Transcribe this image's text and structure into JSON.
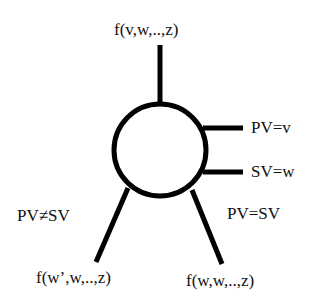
{
  "diagram": {
    "node": {
      "shape": "circle",
      "stroke_color": "#000000"
    },
    "top_output": {
      "label": "f(v,w,..,z)"
    },
    "right_inputs": [
      {
        "label": "PV=v"
      },
      {
        "label": "SV=w"
      }
    ],
    "branches": [
      {
        "condition": "PV≠SV",
        "result": "f(w’,w,..,z)"
      },
      {
        "condition": "PV=SV",
        "result": "f(w,w,..,z)"
      }
    ]
  }
}
